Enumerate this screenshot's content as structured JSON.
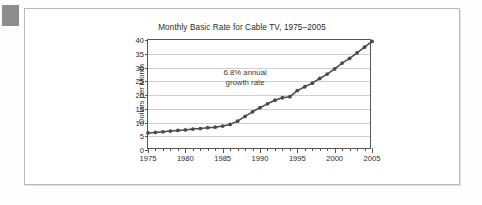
{
  "figure": {
    "background_color": "#fdfdfd",
    "card_border_color": "#b9b9b9",
    "margin_mark_color": "#8d8d8d"
  },
  "chart_data": {
    "type": "line",
    "title": "Monthly Basic Rate for Cable TV, 1975–2005",
    "xlabel": "",
    "ylabel": "Dollars per Month",
    "xlim": [
      1975,
      2005
    ],
    "ylim": [
      0,
      40
    ],
    "grid": "horizontal",
    "legend": "none",
    "series_color": "#4a4a4a",
    "marker": "circle",
    "annotations": [
      {
        "text_line_1": "6.8% annual",
        "text_line_2": "growth rate",
        "x": 1988,
        "y": 26
      }
    ],
    "y_ticks": [
      0,
      5,
      10,
      15,
      20,
      25,
      30,
      35,
      40
    ],
    "x_ticks": [
      1975,
      1976,
      1977,
      1978,
      1979,
      1980,
      1981,
      1982,
      1983,
      1984,
      1985,
      1986,
      1987,
      1988,
      1989,
      1990,
      1991,
      1992,
      1993,
      1994,
      1995,
      1996,
      1997,
      1998,
      1999,
      2000,
      2001,
      2002,
      2003,
      2004,
      2005
    ],
    "x_tick_labels": [
      1975,
      1980,
      1985,
      1990,
      1995,
      2000,
      2005
    ],
    "x": [
      1975,
      1976,
      1977,
      1978,
      1979,
      1980,
      1981,
      1982,
      1983,
      1984,
      1985,
      1986,
      1987,
      1988,
      1989,
      1990,
      1991,
      1992,
      1993,
      1994,
      1995,
      1996,
      1997,
      1998,
      1999,
      2000,
      2001,
      2002,
      2003,
      2004,
      2005
    ],
    "values": [
      6.2,
      6.4,
      6.6,
      6.9,
      7.1,
      7.3,
      7.6,
      7.8,
      8.1,
      8.3,
      8.7,
      9.3,
      10.5,
      12.2,
      13.9,
      15.4,
      16.8,
      18.1,
      19.0,
      19.4,
      21.6,
      23.0,
      24.3,
      26.0,
      27.6,
      29.5,
      31.6,
      33.3,
      35.3,
      37.4,
      39.5
    ]
  }
}
